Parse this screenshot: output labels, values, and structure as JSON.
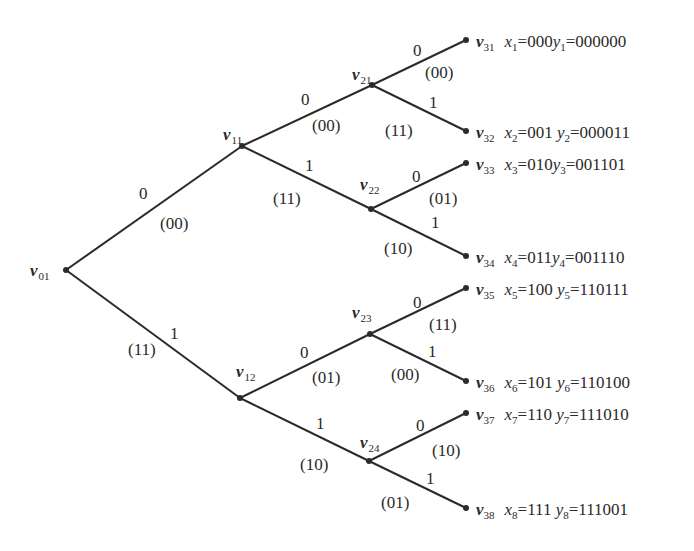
{
  "diagram": {
    "type": "binary-code-tree",
    "nodes": [
      {
        "id": "v01",
        "name": "v",
        "sub": "01",
        "x": 66,
        "y": 270
      },
      {
        "id": "v11",
        "name": "v",
        "sub": "11",
        "x": 242,
        "y": 146
      },
      {
        "id": "v12",
        "name": "v",
        "sub": "12",
        "x": 240,
        "y": 398
      },
      {
        "id": "v21",
        "name": "v",
        "sub": "21",
        "x": 372,
        "y": 85
      },
      {
        "id": "v22",
        "name": "v",
        "sub": "22",
        "x": 371,
        "y": 209
      },
      {
        "id": "v23",
        "name": "v",
        "sub": "23",
        "x": 370,
        "y": 334
      },
      {
        "id": "v24",
        "name": "v",
        "sub": "24",
        "x": 369,
        "y": 461
      },
      {
        "id": "v31",
        "name": "v",
        "sub": "31",
        "x": 466,
        "y": 40
      },
      {
        "id": "v32",
        "name": "v",
        "sub": "32",
        "x": 466,
        "y": 131
      },
      {
        "id": "v33",
        "name": "v",
        "sub": "33",
        "x": 466,
        "y": 163
      },
      {
        "id": "v34",
        "name": "v",
        "sub": "34",
        "x": 466,
        "y": 256
      },
      {
        "id": "v35",
        "name": "v",
        "sub": "35",
        "x": 466,
        "y": 288
      },
      {
        "id": "v36",
        "name": "v",
        "sub": "36",
        "x": 466,
        "y": 381
      },
      {
        "id": "v37",
        "name": "v",
        "sub": "37",
        "x": 466,
        "y": 413
      },
      {
        "id": "v38",
        "name": "v",
        "sub": "38",
        "x": 466,
        "y": 508
      }
    ],
    "edges": [
      {
        "from": "v01",
        "to": "v11",
        "input": "0",
        "output": "(00)"
      },
      {
        "from": "v01",
        "to": "v12",
        "input": "1",
        "output": "(11)"
      },
      {
        "from": "v11",
        "to": "v21",
        "input": "0",
        "output": "(00)"
      },
      {
        "from": "v11",
        "to": "v22",
        "input": "1",
        "output": "(11)"
      },
      {
        "from": "v12",
        "to": "v23",
        "input": "0",
        "output": "(01)"
      },
      {
        "from": "v12",
        "to": "v24",
        "input": "1",
        "output": "(10)"
      },
      {
        "from": "v21",
        "to": "v31",
        "input": "0",
        "output": "(00)"
      },
      {
        "from": "v21",
        "to": "v32",
        "input": "1",
        "output": "(11)"
      },
      {
        "from": "v22",
        "to": "v33",
        "input": "0",
        "output": "(01)"
      },
      {
        "from": "v22",
        "to": "v34",
        "input": "1",
        "output": "(10)"
      },
      {
        "from": "v23",
        "to": "v35",
        "input": "0",
        "output": "(11)"
      },
      {
        "from": "v23",
        "to": "v36",
        "input": "1",
        "output": "(00)"
      },
      {
        "from": "v24",
        "to": "v37",
        "input": "0",
        "output": "(10)"
      },
      {
        "from": "v24",
        "to": "v38",
        "input": "1",
        "output": "(01)"
      }
    ],
    "leaves": [
      {
        "node_sub": "31",
        "x_sub": "1",
        "x_val": "000",
        "y_sub": "1",
        "y_val": "000000"
      },
      {
        "node_sub": "32",
        "x_sub": "2",
        "x_val": "001",
        "y_sub": "2",
        "y_val": "000011"
      },
      {
        "node_sub": "33",
        "x_sub": "3",
        "x_val": "010",
        "y_sub": "3",
        "y_val": "001101"
      },
      {
        "node_sub": "34",
        "x_sub": "4",
        "x_val": "011",
        "y_sub": "4",
        "y_val": "001110"
      },
      {
        "node_sub": "35",
        "x_sub": "5",
        "x_val": "100",
        "y_sub": "5",
        "y_val": "110111"
      },
      {
        "node_sub": "36",
        "x_sub": "6",
        "x_val": "101",
        "y_sub": "6",
        "y_val": "110100"
      },
      {
        "node_sub": "37",
        "x_sub": "7",
        "x_val": "110",
        "y_sub": "7",
        "y_val": "111010"
      },
      {
        "node_sub": "38",
        "x_sub": "8",
        "x_val": "111",
        "y_sub": "8",
        "y_val": "111001"
      }
    ],
    "labels": {
      "node_letter": "v",
      "x_letter": "x",
      "y_letter": "y",
      "equals": "="
    },
    "colors": {
      "line": "#2a2a2a",
      "text": "#2a2a2a",
      "background": "#ffffff"
    }
  }
}
